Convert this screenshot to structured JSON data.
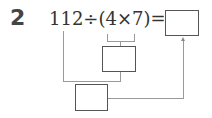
{
  "problem": {
    "number": "2",
    "expression": "112÷(4×7)=",
    "parts": {
      "dividend": "112",
      "divide_sign": "÷",
      "open_paren": "(",
      "factor_a": "4",
      "times_sign": "×",
      "factor_b": "7",
      "close_paren": ")",
      "equals_sign": "="
    },
    "answer_box": "",
    "step1_box": "",
    "step2_box": ""
  }
}
